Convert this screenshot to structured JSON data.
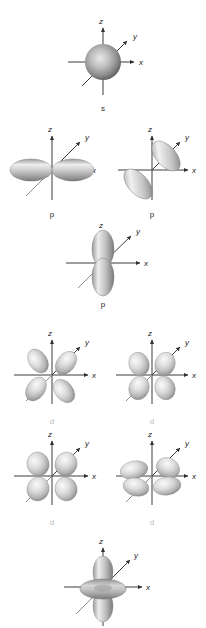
{
  "figure": {
    "title_fragment": "",
    "background_color": "#ffffff",
    "axis_label_color": "#1a1a1a",
    "orbital_label_color": "#2a2a2a",
    "orbital_label_dim_color": "#b9b9b9",
    "axis_color": "#3c3c3c",
    "lobe_fill_light": "#f0f0f0",
    "lobe_fill_mid": "#c8c8c8",
    "lobe_fill_dark": "#6e6e6e",
    "sphere_fill_center": "#dedede",
    "sphere_fill_edge": "#6b6b6b"
  },
  "axes": {
    "x": "x",
    "y": "y",
    "z": "z"
  },
  "orbitals": [
    {
      "id": "s",
      "label": "s",
      "label_style": "dark",
      "shape": "sphere",
      "row": 1,
      "column": "center"
    },
    {
      "id": "p-x",
      "label": "p",
      "label_style": "dark",
      "shape": "two-lobe-horizontal",
      "row": 2,
      "column": "left"
    },
    {
      "id": "p-y",
      "label": "p",
      "label_style": "dark",
      "shape": "two-lobe-diagonal",
      "row": 2,
      "column": "right"
    },
    {
      "id": "p-z",
      "label": "p",
      "label_style": "dark",
      "shape": "two-lobe-vertical",
      "row": 3,
      "column": "center"
    },
    {
      "id": "d-1",
      "label": "d",
      "label_style": "dim",
      "shape": "four-lobe-tilted",
      "row": 4,
      "column": "left"
    },
    {
      "id": "d-2",
      "label": "d",
      "label_style": "dim",
      "shape": "four-lobe-cross",
      "row": 4,
      "column": "right"
    },
    {
      "id": "d-3",
      "label": "d",
      "label_style": "dim",
      "shape": "four-lobe-cross-wide",
      "row": 5,
      "column": "left"
    },
    {
      "id": "d-4",
      "label": "d",
      "label_style": "dim",
      "shape": "four-lobe-flat",
      "row": 5,
      "column": "right"
    },
    {
      "id": "d-z2",
      "label": "",
      "label_style": "dim",
      "shape": "dumbbell-with-torus",
      "row": 6,
      "column": "center"
    }
  ]
}
